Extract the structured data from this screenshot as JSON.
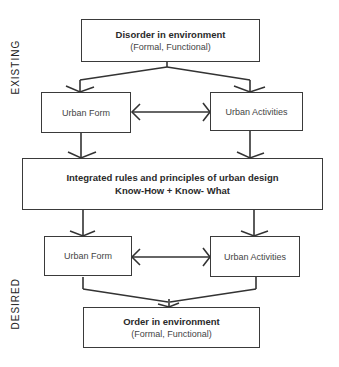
{
  "side_labels": {
    "existing": "EXISTING",
    "desired": "DESIRED"
  },
  "existing": {
    "top_box": {
      "title": "Disorder in environment",
      "subtitle": "(Formal, Functional)"
    },
    "left_box": {
      "label": "Urban Form"
    },
    "right_box": {
      "label": "Urban Activities"
    }
  },
  "middle_box": {
    "title": "Integrated rules and principles of urban design",
    "subtitle": "Know-How + Know- What"
  },
  "desired": {
    "left_box": {
      "label": "Urban Form"
    },
    "right_box": {
      "label": "Urban Activities"
    },
    "bottom_box": {
      "title": "Order in environment",
      "subtitle": "(Formal, Functional)"
    }
  },
  "colors": {
    "stroke": "#3a3a3a",
    "background": "#ffffff"
  }
}
